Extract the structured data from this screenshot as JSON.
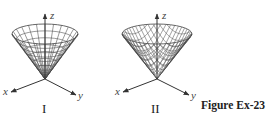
{
  "figure": {
    "caption": "Figure Ex-23",
    "top_text_fragment": "",
    "plots": [
      {
        "label": "I",
        "surface": "cone with radial/circular grid",
        "axes": {
          "z": "z",
          "x": "x",
          "y": "y"
        },
        "vertex": [
          45,
          79
        ],
        "rim_center": [
          45,
          34
        ],
        "rim_rx": 33,
        "rim_ry": 10,
        "grid": "polar"
      },
      {
        "label": "II",
        "surface": "cone with square (rectangular) grid",
        "axes": {
          "z": "z",
          "x": "x",
          "y": "y"
        },
        "vertex": [
          157,
          79
        ],
        "rim_center": [
          157,
          34
        ],
        "rim_rx": 35,
        "rim_ry": 10,
        "grid": "rectangular"
      }
    ]
  },
  "colors": {
    "line": "#555555",
    "axis": "#333333",
    "background": "#ffffff"
  }
}
